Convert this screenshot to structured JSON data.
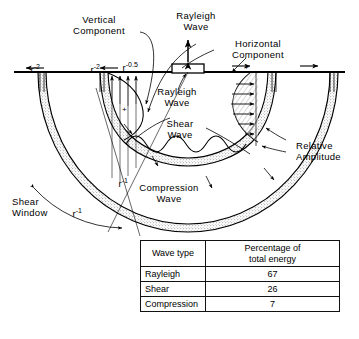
{
  "diagram": {
    "labels": {
      "vertical_component": "Vertical\nComponent",
      "rayleigh_wave_top": "Rayleigh\nWave",
      "horizontal_component": "Horizontal\nComponent",
      "rayleigh_wave_source": "Rayleigh\nWave",
      "shear_wave": "Shear\nWave",
      "compression_wave": "Compression\nWave",
      "relative_amplitude": "Relative\nAmplitude",
      "shear_window": "Shear\nWindow"
    },
    "attenuation": {
      "left_outer": "r",
      "left_outer_exp": "-2",
      "left_inner": "r",
      "left_inner_exp": "-2",
      "rayleigh": "r",
      "rayleigh_exp": "-0.5",
      "shear_body": "r",
      "shear_body_exp": "-1",
      "window_arc": "r",
      "window_arc_exp": "-1"
    },
    "polarity_marks": {
      "vertical_plus": "+",
      "horizontal_plus": "+"
    },
    "colors": {
      "ink": "#000000",
      "background": "#ffffff",
      "stipple": "#d8d4cc",
      "hatch": "#9a9a9a"
    }
  },
  "table": {
    "headers": [
      "Wave type",
      "Percentage of\ntotal energy"
    ],
    "header_col0": "Wave type",
    "header_col1_line1": "Percentage of",
    "header_col1_line2": "total energy",
    "rows": [
      {
        "wave_type": "Rayleigh",
        "percentage": "67"
      },
      {
        "wave_type": "Shear",
        "percentage": "26"
      },
      {
        "wave_type": "Compression",
        "percentage": "7"
      }
    ]
  }
}
